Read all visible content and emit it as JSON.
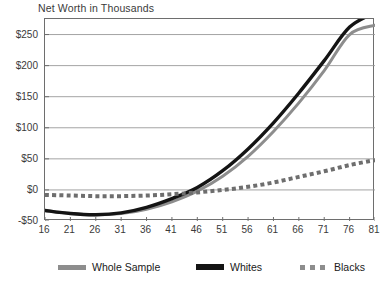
{
  "chart_data": {
    "type": "line",
    "title": "Net Worth in Thousands",
    "xlabel": "",
    "ylabel": "",
    "x": [
      16,
      21,
      26,
      31,
      36,
      41,
      46,
      51,
      56,
      61,
      66,
      71,
      76,
      81
    ],
    "xticklabels": [
      "16",
      "21",
      "26",
      "31",
      "36",
      "41",
      "46",
      "51",
      "56",
      "61",
      "66",
      "71",
      "76",
      "81"
    ],
    "xlim": [
      16,
      81
    ],
    "ylim": [
      -50,
      275
    ],
    "yticks": [
      -50,
      0,
      50,
      100,
      150,
      200,
      250
    ],
    "yticklabels": [
      "-$50",
      "$0",
      "$50",
      "$100",
      "$150",
      "$200",
      "$250"
    ],
    "grid": "horizontal",
    "legend_position": "bottom",
    "series": [
      {
        "name": "Whole Sample",
        "style": "solid",
        "color": "#8d8d8d",
        "width": 3,
        "values": [
          -33,
          -38,
          -40,
          -38,
          -31,
          -19,
          -2,
          22,
          54,
          94,
          140,
          192,
          250,
          265
        ]
      },
      {
        "name": "Whites",
        "style": "solid",
        "color": "#141414",
        "width": 3.4,
        "values": [
          -33,
          -38,
          -40,
          -37,
          -28,
          -14,
          4,
          31,
          66,
          108,
          156,
          208,
          262,
          285
        ]
      },
      {
        "name": "Blacks",
        "style": "dotted",
        "color": "#6e6e6e",
        "width": 4,
        "values": [
          -8,
          -9,
          -10,
          -10,
          -9,
          -7,
          -4,
          0,
          5,
          12,
          21,
          30,
          40,
          48
        ]
      }
    ]
  },
  "legend": {
    "items": [
      {
        "label": "Whole Sample",
        "swatch": "solid-gray"
      },
      {
        "label": "Whites",
        "swatch": "solid-black"
      },
      {
        "label": "Blacks",
        "swatch": "dotted-gray"
      }
    ]
  }
}
